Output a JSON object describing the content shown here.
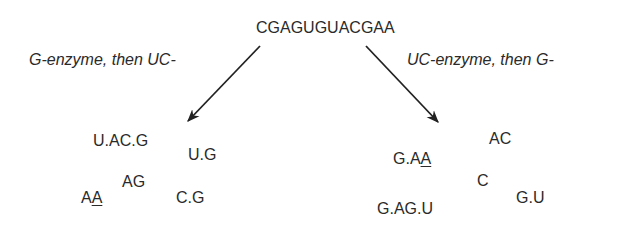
{
  "sequence": "CGAGUGUACGAA",
  "left_branch": {
    "label": "G-enzyme, then UC-",
    "fragments": [
      {
        "text": "U.AC.G"
      },
      {
        "text": "U.G"
      },
      {
        "text": "AG"
      },
      {
        "text_plain": "A",
        "text_underlined": "A"
      },
      {
        "text": "C.G"
      }
    ]
  },
  "right_branch": {
    "label": "UC-enzyme, then G-",
    "fragments": [
      {
        "text": "AC"
      },
      {
        "text_plain": "G.A",
        "text_underlined": "A"
      },
      {
        "text": "C"
      },
      {
        "text": "G.U"
      },
      {
        "text": "G.AG.U"
      }
    ]
  },
  "colors": {
    "text": "#2a2a2a",
    "arrow": "#222222",
    "background": "#ffffff"
  }
}
